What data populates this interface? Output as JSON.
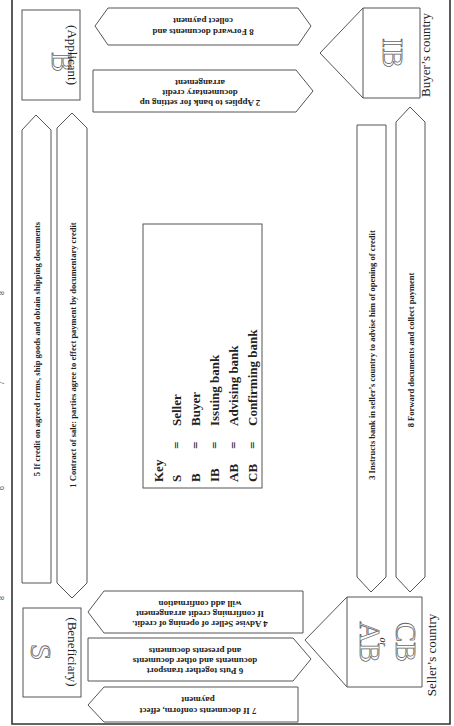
{
  "diagram": {
    "orientation": "rotated 90 degrees counter-clockwise",
    "regions": {
      "buyers_country": "Buyer’s country",
      "sellers_country": "Seller’s country"
    },
    "parties": {
      "buyer": {
        "letter": "B",
        "role": "(Applicant)"
      },
      "seller": {
        "letter": "S",
        "role": "(Beneficiary)"
      },
      "issuing_bank": {
        "letter": "IB"
      },
      "advising_bank": {
        "letter_1": "AB",
        "or": "or",
        "letter_2": "CB"
      }
    },
    "arrows": {
      "step1": "1 Contract of sale: parties agree to effect payment by documentary credit",
      "step2": {
        "line1": "2 Applies to bank for setting up",
        "line2": "documentary credit",
        "line3": "arrangement"
      },
      "step3": "3 Instructs bank in seller’s country to advise him of opening of credit",
      "step4": {
        "line1": "4 Advise Seller of opening of credit.",
        "line2": "If confirming credit arrangement",
        "line3": "will add confirmation"
      },
      "step5": "5 If credit on agreed terms, ship goods and obtain shipping documents",
      "step6": {
        "line1": "6 Puts together transport",
        "line2": "documents and other documents",
        "line3": "and presents documents"
      },
      "step7": {
        "line1": "7 If documents conform, effect",
        "line2": "payment"
      },
      "step8_buyer": {
        "line1": "8 Forward documents and",
        "line2": "collect payment"
      },
      "step8_seller": "8 Forward documents and collect payment"
    },
    "key": {
      "title": "Key",
      "entries": [
        {
          "abbr": "S",
          "eq": "=",
          "meaning": "Seller"
        },
        {
          "abbr": "B",
          "eq": "=",
          "meaning": "Buyer"
        },
        {
          "abbr": "IB",
          "eq": "=",
          "meaning": "Issuing bank"
        },
        {
          "abbr": "AB",
          "eq": "=",
          "meaning": "Advising bank"
        },
        {
          "abbr": "CB",
          "eq": "=",
          "meaning": "Confirming bank"
        }
      ]
    },
    "cropped_caption_fragments": [
      "8",
      "7",
      "6",
      "8"
    ]
  }
}
